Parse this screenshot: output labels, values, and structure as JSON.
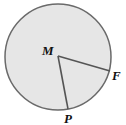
{
  "diagram": {
    "type": "circle-with-radii",
    "center": {
      "label": "M",
      "x": 58,
      "y": 56
    },
    "radius": 53,
    "points": [
      {
        "label": "F",
        "x": 110,
        "y": 71
      },
      {
        "label": "P",
        "x": 68,
        "y": 109
      }
    ],
    "colors": {
      "fill": "#e6e6e6",
      "stroke": "#666666",
      "text": "#111111"
    }
  }
}
